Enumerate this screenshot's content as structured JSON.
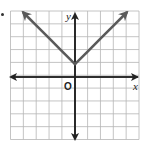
{
  "chart_data": {
    "type": "line",
    "title": "",
    "xlabel": "x",
    "ylabel": "y",
    "origin_label": "O",
    "function": "y = |x| + 1",
    "xlim": [
      -5,
      5
    ],
    "ylim": [
      -5,
      5
    ],
    "grid": true,
    "series": [
      {
        "name": "left branch",
        "x": [
          -4,
          -3,
          -2,
          -1,
          0
        ],
        "y": [
          5,
          4,
          3,
          2,
          1
        ],
        "arrow": "start"
      },
      {
        "name": "right branch",
        "x": [
          0,
          1,
          2,
          3,
          4
        ],
        "y": [
          1,
          2,
          3,
          4,
          5
        ],
        "arrow": "end"
      }
    ],
    "vertex": {
      "x": 0,
      "y": 1
    },
    "colors": {
      "graph": "#5a5a5a",
      "axes": "#222222",
      "grid": "#b5b5b5"
    }
  },
  "labels": {
    "x": "x",
    "y": "y",
    "origin": "O"
  }
}
